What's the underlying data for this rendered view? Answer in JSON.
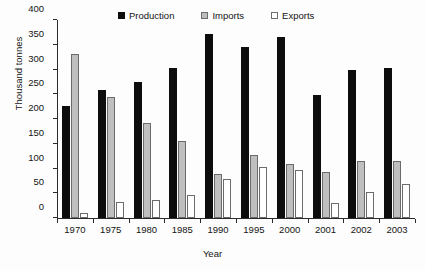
{
  "chart_data": {
    "type": "bar",
    "title": "",
    "xlabel": "Year",
    "ylabel": "Thousand tonnes",
    "categories": [
      "1970",
      "1975",
      "1980",
      "1985",
      "1990",
      "1995",
      "2000",
      "2001",
      "2002",
      "2003"
    ],
    "series": [
      {
        "name": "Production",
        "color": "#0d0d0d",
        "values": [
          227,
          259,
          275,
          304,
          371,
          345,
          365,
          248,
          299,
          303
        ]
      },
      {
        "name": "Imports",
        "color": "#bfbfbf",
        "values": [
          332,
          244,
          192,
          155,
          89,
          128,
          109,
          93,
          115,
          115
        ]
      },
      {
        "name": "Exports",
        "color": "#ffffff",
        "values": [
          11,
          33,
          36,
          47,
          78,
          103,
          98,
          30,
          52,
          68
        ]
      }
    ],
    "ylim": [
      0,
      400
    ],
    "yticks": [
      0,
      50,
      100,
      150,
      200,
      250,
      300,
      350,
      400
    ],
    "ytick_labels": [
      "0",
      "50",
      "100",
      "150",
      "200",
      "250",
      "300",
      "350",
      "400"
    ],
    "grid": false,
    "legend_position": "top-center",
    "legend": [
      {
        "label": "Production",
        "swatch": "filled-black-square"
      },
      {
        "label": "Imports",
        "swatch": "filled-gray-square"
      },
      {
        "label": "Exports",
        "swatch": "outlined-white-square"
      }
    ]
  }
}
